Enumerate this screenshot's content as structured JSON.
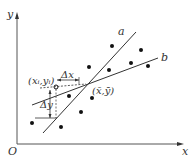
{
  "diagram": {
    "axes": {
      "x_label": "x",
      "y_label": "y",
      "origin_label": "O"
    },
    "lines": [
      {
        "name": "a",
        "label": "a"
      },
      {
        "name": "b",
        "label": "b"
      }
    ],
    "annotations": {
      "point_label": "(x_i, y_i)",
      "point_label_text": "(xᵢ,yᵢ)",
      "mean_label": "(x̄, ȳ)",
      "mean_label_text": "(x̄,ȳ)",
      "delta_x": "Δx",
      "delta_y": "Δy"
    },
    "points": [
      [
        32,
        123
      ],
      [
        61,
        127
      ],
      [
        81,
        112
      ],
      [
        69,
        96
      ],
      [
        92,
        98
      ],
      [
        89,
        67
      ],
      [
        109,
        70
      ],
      [
        112,
        46
      ],
      [
        131,
        63
      ],
      [
        141,
        50
      ],
      [
        148,
        66
      ]
    ],
    "colors": {
      "line": "#333333",
      "point": "#111111",
      "axis": "#555555"
    }
  }
}
